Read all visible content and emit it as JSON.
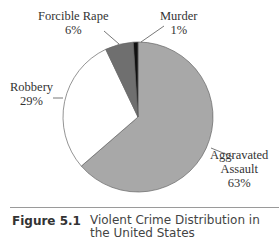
{
  "chart_data": {
    "type": "pie",
    "title": "Violent Crime Distribution in the United States",
    "categories": [
      "Aggravated Assault",
      "Robbery",
      "Forcible Rape",
      "Murder"
    ],
    "values": [
      63,
      29,
      6,
      1
    ],
    "labels": [
      "63%",
      "29%",
      "6%",
      "1%"
    ],
    "colors": [
      "#a8a8a8",
      "#ffffff",
      "#6f6f6f",
      "#111111"
    ],
    "start_angle_deg": -90,
    "direction": "clockwise",
    "legend": "none (callout labels)"
  },
  "labels": {
    "assault": {
      "name_line1": "Aggravated",
      "name_line2": "Assault",
      "pct": "63%"
    },
    "robbery": {
      "name": "Robbery",
      "pct": "29%"
    },
    "rape": {
      "name": "Forcible Rape",
      "pct": "6%"
    },
    "murder": {
      "name": "Murder",
      "pct": "1%"
    }
  },
  "caption": {
    "number": "Figure 5.1",
    "text": "Violent Crime Distribution in the United States"
  }
}
